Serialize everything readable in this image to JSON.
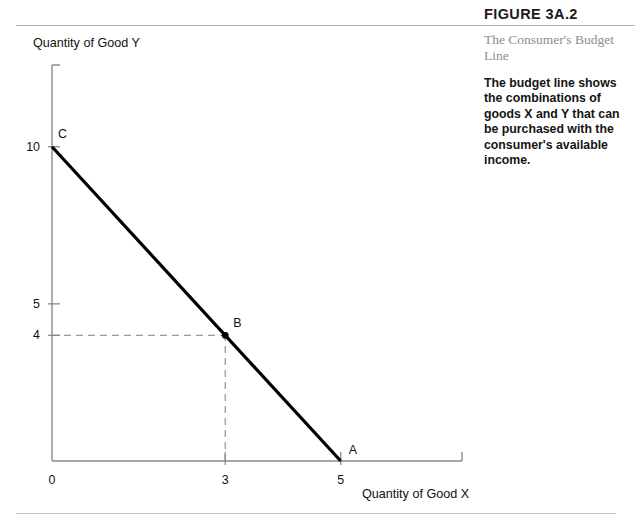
{
  "header": {
    "figure_number": "FIGURE 3A.2"
  },
  "sidebar": {
    "subtitle": "The Consumer's Budget Line",
    "description": "The budget line shows the combinations of goods X and Y that can be purchased with the consumer's available income."
  },
  "chart_data": {
    "type": "line",
    "title": "The Consumer's Budget Line",
    "xlabel": "Quantity of Good X",
    "ylabel": "Quantity of Good Y",
    "xlim": [
      0,
      7.1
    ],
    "ylim": [
      0,
      12.6
    ],
    "grid": false,
    "legend": "none",
    "x_ticks": [
      {
        "value": 0,
        "label": "0"
      },
      {
        "value": 3,
        "label": "3"
      },
      {
        "value": 5,
        "label": "5"
      }
    ],
    "y_ticks": [
      {
        "value": 4,
        "label": "4"
      },
      {
        "value": 5,
        "label": "5"
      },
      {
        "value": 10,
        "label": "10"
      }
    ],
    "series": [
      {
        "name": "Budget line",
        "x": [
          0,
          5
        ],
        "y": [
          10,
          0
        ],
        "color": "#000000",
        "width": 3.2
      }
    ],
    "points": [
      {
        "label": "C",
        "x": 0,
        "y": 10,
        "marker": "none"
      },
      {
        "label": "B",
        "x": 3,
        "y": 4,
        "marker": "dot"
      },
      {
        "label": "A",
        "x": 5,
        "y": 0,
        "marker": "none"
      }
    ],
    "guide_lines": [
      {
        "name": "horizontal-guide-b",
        "from": [
          0,
          4
        ],
        "to": [
          3,
          4
        ],
        "style": "dashed",
        "color": "#9a9a9a"
      },
      {
        "name": "vertical-guide-b",
        "from": [
          3,
          0
        ],
        "to": [
          3,
          4
        ],
        "style": "dashed",
        "color": "#9a9a9a"
      }
    ],
    "axis_color": "#8a8a8a"
  }
}
